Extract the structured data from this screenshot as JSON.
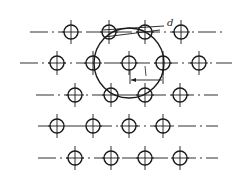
{
  "diagram": {
    "stroke_color": "#1a1a1a",
    "rows": [
      {
        "y": 32,
        "line": [
          30,
          222
        ],
        "holes": [
          71,
          109,
          145,
          181
        ]
      },
      {
        "y": 63,
        "line": [
          20,
          232
        ],
        "holes": [
          57,
          93,
          129,
          163,
          199
        ]
      },
      {
        "y": 95,
        "line": [
          36,
          218
        ],
        "holes": [
          75,
          111,
          145,
          180
        ]
      },
      {
        "y": 126,
        "line": [
          38,
          218
        ],
        "holes": [
          57,
          93,
          129,
          163
        ]
      },
      {
        "y": 158,
        "line": [
          38,
          218
        ],
        "holes": [
          75,
          111,
          145,
          180
        ]
      }
    ],
    "hole_radius": 7,
    "pitch_circle": {
      "cx": 129,
      "cy": 63,
      "r": 35
    },
    "labels": {
      "diameter": "d",
      "length": "L"
    }
  }
}
